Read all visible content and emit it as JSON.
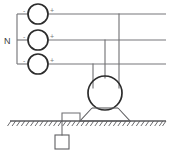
{
  "diagram": {
    "type": "electrical-schematic",
    "canvas": {
      "width": 176,
      "height": 153,
      "background": "#ffffff"
    },
    "colors": {
      "wire": "#6f6f72",
      "component_outline": "#2b2b2b",
      "ground": "#5a5a5d",
      "label": "#3c3c3e",
      "polarity": "#78787b"
    },
    "labels": {
      "neutral": "N",
      "positive": "+",
      "negative": "-"
    },
    "sources": [
      {
        "name": "source-top",
        "cx": 38,
        "cy": 14,
        "r": 10,
        "minus_label": "-",
        "minus_x": 24,
        "minus_y": 12,
        "plus_label": "+",
        "plus_x": 50,
        "plus_y": 12,
        "bus_y": 14
      },
      {
        "name": "source-middle",
        "cx": 38,
        "cy": 40,
        "r": 10,
        "minus_label": "-",
        "minus_x": 24,
        "minus_y": 38,
        "plus_label": "+",
        "plus_x": 50,
        "plus_y": 38,
        "bus_y": 40
      },
      {
        "name": "source-bottom",
        "cx": 38,
        "cy": 64,
        "r": 10,
        "minus_label": "-",
        "minus_x": 24,
        "minus_y": 62,
        "plus_label": "+",
        "plus_x": 50,
        "plus_y": 62,
        "bus_y": 64
      }
    ],
    "bus": {
      "left_x": 17,
      "right_x": 166,
      "top_y": 14,
      "mid_y": 40,
      "bot_y": 64,
      "neutral_label_x": 8,
      "neutral_label_y": 43
    },
    "droppers": [
      {
        "name": "dropper-from-top-bus",
        "x": 119,
        "from_y": 14,
        "to_y": 86
      },
      {
        "name": "dropper-from-mid-bus",
        "x": 105,
        "from_y": 40,
        "to_y": 86
      },
      {
        "name": "dropper-from-bot-bus",
        "x": 93,
        "from_y": 64,
        "to_y": 86
      }
    ],
    "machine": {
      "name": "rotating-machine",
      "cx": 105,
      "cy": 93,
      "r": 17
    },
    "base": {
      "name": "machine-foundation",
      "top_left_x": 92,
      "top_right_x": 118,
      "top_y": 108,
      "bottom_left_x": 80,
      "bottom_right_x": 130,
      "bottom_y": 121
    },
    "earth": {
      "name": "earth-connection",
      "from_x": 80,
      "from_y": 121,
      "corner_x": 62,
      "corner_y": 113,
      "down_x": 62,
      "down_to_y": 135,
      "electrode": {
        "x": 55,
        "y": 135,
        "width": 14,
        "height": 14
      }
    },
    "ground": {
      "name": "ground-surface",
      "y": 121,
      "x_start": 10,
      "x_end": 166,
      "hatch_count": 34,
      "hatch_length": 6
    }
  }
}
